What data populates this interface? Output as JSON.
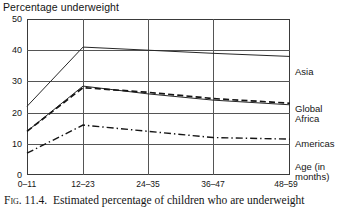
{
  "chart_data": {
    "type": "line",
    "title": "Percentage underweight",
    "xlabel": "Age (in months)",
    "ylabel": "",
    "categories": [
      "0–11",
      "12–23",
      "24–35",
      "36–47",
      "48–59"
    ],
    "ylim": [
      0,
      50
    ],
    "yticks": [
      0,
      10,
      20,
      30,
      40,
      50
    ],
    "grid": true,
    "legend_position": "right-of-axis",
    "series": [
      {
        "name": "Asia",
        "values": [
          22,
          41,
          40,
          39,
          38
        ],
        "style": "solid",
        "color": "#262626"
      },
      {
        "name": "Global",
        "values": [
          14,
          28.5,
          26,
          24,
          22.5
        ],
        "style": "solid",
        "color": "#262626"
      },
      {
        "name": "Africa",
        "values": [
          14,
          28,
          26.5,
          24.5,
          23
        ],
        "style": "dashed",
        "color": "#1a1a1a"
      },
      {
        "name": "Americas",
        "values": [
          7,
          16,
          14,
          12,
          11.5
        ],
        "style": "dash-dot",
        "color": "#1a1a1a"
      }
    ]
  },
  "figure": {
    "number_label": "Fig. 11.4.",
    "caption_text": "Estimated percentage of children who are underweight"
  },
  "legend": {
    "asia": "Asia",
    "global": "Global",
    "africa": "Africa",
    "americas": "Americas",
    "age_line1": "Age (in",
    "age_line2": "months)"
  },
  "yticks_text": [
    "50",
    "40",
    "30",
    "20",
    "10",
    "0"
  ],
  "colors": {
    "axis": "#3a3a3a",
    "grid": "#555555",
    "line": "#1a1a1a",
    "text": "#141414",
    "background": "#ffffff"
  }
}
